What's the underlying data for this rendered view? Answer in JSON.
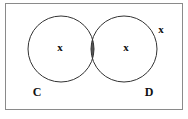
{
  "diagram": {
    "type": "venn",
    "sets": [
      {
        "label": "C",
        "cx": 61,
        "cy": 49,
        "r": 33
      },
      {
        "label": "D",
        "cx": 124,
        "cy": 49,
        "r": 33
      }
    ],
    "shaded_region": "C ∩ D",
    "shade_color": "#555555",
    "stroke_color": "#333333",
    "frame_color": "#888888",
    "markers": [
      {
        "symbol": "x",
        "x": 60,
        "y": 48,
        "region": "C only"
      },
      {
        "symbol": "x",
        "x": 126,
        "y": 48,
        "region": "D only"
      },
      {
        "symbol": "x",
        "x": 161,
        "y": 30,
        "region": "outside"
      }
    ]
  },
  "labels": {
    "set_c": "C",
    "set_d": "D",
    "marker": "x"
  }
}
